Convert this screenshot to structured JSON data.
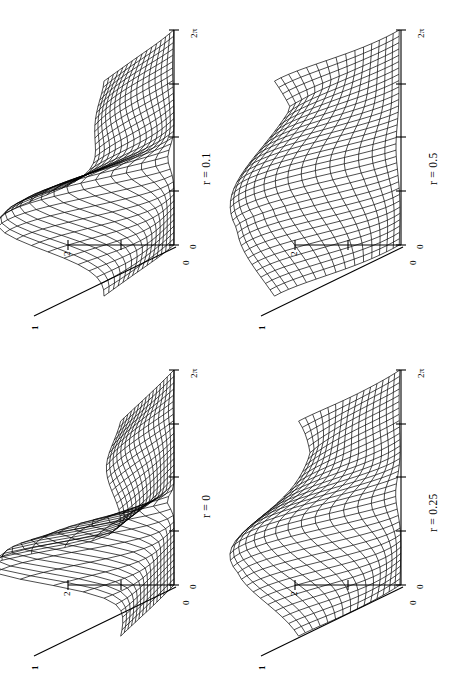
{
  "figure": {
    "title": "",
    "background_color": "#ffffff",
    "ink_color": "#000000",
    "layout": "2x2 grid of 3D wireframe surface plots, page rotated 90 degrees (landscape content on portrait page)",
    "panel_count": 4
  },
  "panels": [
    {
      "id": "panel-r-0.1",
      "position": "top-left",
      "condition_label": "r = 0.1",
      "r_value": 0.1,
      "axis_phase_start_label": "0",
      "axis_phase_end_label": "2π",
      "axis_height_label": "2",
      "axis_height_origin_label": "0",
      "axis_depth_label": "1",
      "axis_depth_origin_label": "0",
      "description": "sharp narrow ridge with tall crest near low phase and a secondary fold"
    },
    {
      "id": "panel-r-0.5",
      "position": "top-right",
      "condition_label": "r = 0.5",
      "r_value": 0.5,
      "axis_phase_start_label": "0",
      "axis_phase_end_label": "2π",
      "axis_height_label": "2",
      "axis_height_origin_label": "0",
      "axis_depth_label": "1",
      "axis_depth_origin_label": "0",
      "description": "broad smooth S-shaped wave, widest and most rounded of the four"
    },
    {
      "id": "panel-r-0",
      "position": "bottom-left",
      "condition_label": "r = 0",
      "r_value": 0,
      "axis_phase_start_label": "0",
      "axis_phase_end_label": "2π",
      "axis_height_label": "2",
      "axis_height_origin_label": "0",
      "axis_depth_label": "1",
      "axis_depth_origin_label": "0",
      "description": "extremely sharp single spike, near-delta ridge collapsing to a thin blade"
    },
    {
      "id": "panel-r-0.25",
      "position": "bottom-right",
      "condition_label": "r = 0.25",
      "r_value": 0.25,
      "axis_phase_start_label": "0",
      "axis_phase_end_label": "2π",
      "axis_height_label": "2",
      "axis_height_origin_label": "0",
      "axis_depth_label": "1",
      "axis_depth_origin_label": "0",
      "description": "rounded broad hump with trailing fold, intermediate smoothness"
    }
  ],
  "chart_data": {
    "type": "line",
    "subtype": "3d-wireframe-surface-grid",
    "title": "",
    "xlabel": "",
    "ylabel": "",
    "zlabel": "",
    "grid": false,
    "legend_position": "none",
    "shared_axes": {
      "phase_axis": {
        "label": "",
        "ticks": [
          "0",
          "",
          "",
          "",
          "2π"
        ],
        "range": [
          0,
          6.2832
        ],
        "tick_values": [
          0,
          1.5708,
          3.1416,
          4.7124,
          6.2832
        ]
      },
      "height_axis": {
        "label": "",
        "ticks": [
          "0",
          "",
          "2"
        ],
        "range": [
          0,
          2
        ],
        "tick_values": [
          0,
          1,
          2
        ]
      },
      "depth_axis": {
        "label": "",
        "ticks": [
          "0",
          "1"
        ],
        "range": [
          0,
          1
        ],
        "tick_values": [
          0,
          1
        ]
      }
    },
    "series": [
      {
        "name": "r = 0",
        "panel": "bottom-left",
        "peak_height": 2.6,
        "peak_phase": 2.0,
        "width": 0.35,
        "secondary_peak_height": 0.55,
        "secondary_peak_phase": 4.9
      },
      {
        "name": "r = 0.1",
        "panel": "top-left",
        "peak_height": 2.35,
        "peak_phase": 2.1,
        "width": 0.6,
        "secondary_peak_height": 0.9,
        "secondary_peak_phase": 4.9
      },
      {
        "name": "r = 0.25",
        "panel": "bottom-right",
        "peak_height": 2.0,
        "peak_phase": 2.2,
        "width": 0.95,
        "secondary_peak_height": 1.15,
        "secondary_peak_phase": 5.0
      },
      {
        "name": "r = 0.5",
        "panel": "top-right",
        "peak_height": 1.75,
        "peak_phase": 2.35,
        "width": 1.35,
        "secondary_peak_height": 1.3,
        "secondary_peak_phase": 5.1
      }
    ]
  }
}
